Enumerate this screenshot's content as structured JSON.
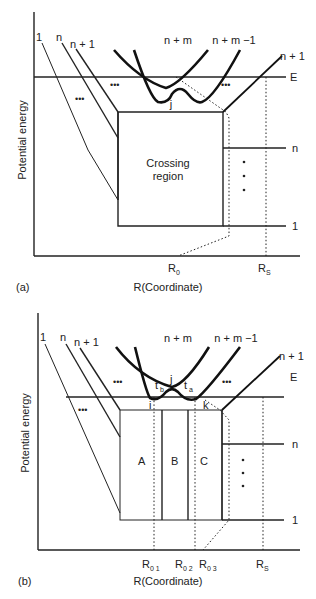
{
  "panel_a": {
    "tag": "(a)",
    "y_axis_label": "Potential energy",
    "x_axis_label": "R(Coordinate)",
    "curve_labels": {
      "c1": "1",
      "cn": "n",
      "cn1": "n + 1",
      "cnm": "n + m",
      "cnm1": "n + m −1",
      "cn1_right": "n + 1"
    },
    "energy_label": "E",
    "right_levels": {
      "n": "n",
      "one": "1"
    },
    "crossing_region_line1": "Crossing",
    "crossing_region_line2": "region",
    "avoided_crossing": "j",
    "ellipsis": "•••",
    "x_ticks": {
      "r0": "R",
      "r0_sub": "0",
      "rs": "R",
      "rs_sub": "S"
    }
  },
  "panel_b": {
    "tag": "(b)",
    "y_axis_label": "Potential energy",
    "x_axis_label": "R(Coordinate)",
    "curve_labels": {
      "c1": "1",
      "cn": "n",
      "cn1": "n + 1",
      "cnm": "n + m",
      "cnm1": "n + m −1",
      "cn1_right": "n + 1"
    },
    "energy_label": "E",
    "right_levels": {
      "n": "n",
      "one": "1"
    },
    "regions": {
      "a": "A",
      "b": "B",
      "c": "C"
    },
    "points": {
      "i": "i",
      "j": "j",
      "k": "k",
      "tb": "t",
      "tb_sub": "b",
      "ta": "t",
      "ta_sub": "a"
    },
    "x_ticks": {
      "r01": "R",
      "r01_sub": "0 1",
      "r02": "R",
      "r02_sub": "0 2",
      "r03": "R",
      "r03_sub": "0 3",
      "rs": "R",
      "rs_sub": "S"
    }
  }
}
